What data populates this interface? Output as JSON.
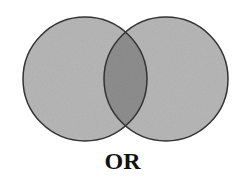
{
  "diagram": {
    "type": "venn",
    "operator_label": "OR",
    "circles": [
      {
        "name": "set-a",
        "cx": 85,
        "cy": 79,
        "r": 62
      },
      {
        "name": "set-b",
        "cx": 166,
        "cy": 79,
        "r": 62
      }
    ],
    "colors": {
      "fill": "#b8b8b8",
      "overlap": "#8f8f8f",
      "stroke": "#333333",
      "background": "#ffffff"
    }
  }
}
